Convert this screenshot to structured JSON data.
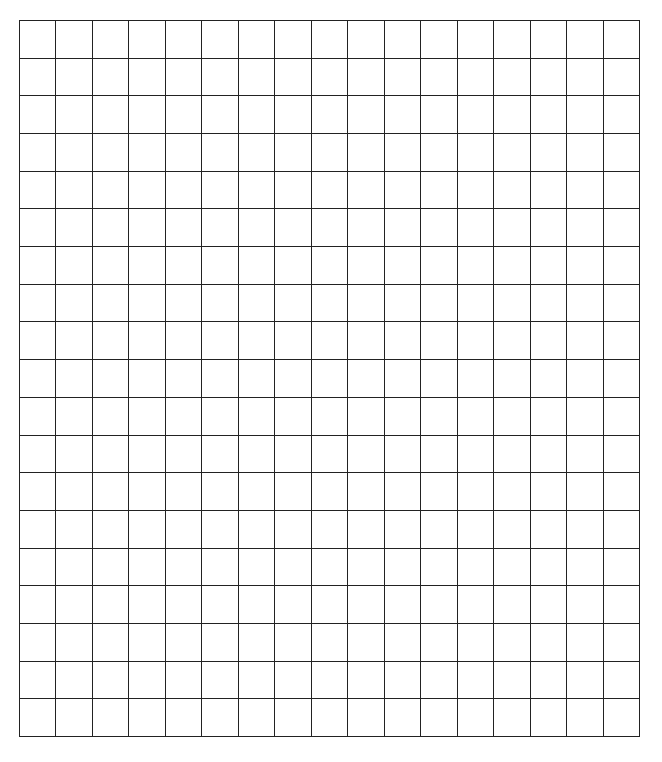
{
  "grid": {
    "columns": 17,
    "rows": 19,
    "line_color": "#222222",
    "background_color": "#ffffff",
    "cells_filled": []
  }
}
